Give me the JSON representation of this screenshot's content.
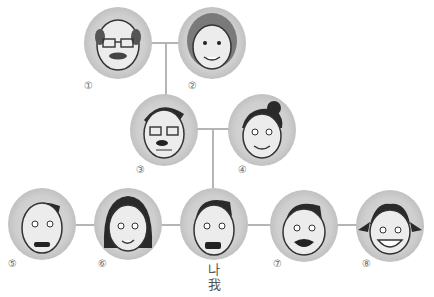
{
  "diagram": {
    "type": "family-tree",
    "members": [
      {
        "id": "1",
        "marker": "①",
        "depiction": "grandfather (bald, glasses, mustache)",
        "generation": 1
      },
      {
        "id": "2",
        "marker": "②",
        "depiction": "grandmother (curly hair)",
        "generation": 1
      },
      {
        "id": "3",
        "marker": "③",
        "depiction": "father (glasses, mustache)",
        "generation": 2
      },
      {
        "id": "4",
        "marker": "④",
        "depiction": "mother (hair bun)",
        "generation": 2
      },
      {
        "id": "5",
        "marker": "⑤",
        "depiction": "older brother",
        "generation": 3
      },
      {
        "id": "6",
        "marker": "⑥",
        "depiction": "older sister",
        "generation": 3
      },
      {
        "id": "me",
        "marker": "",
        "label_ko": "나",
        "label_zh": "我",
        "depiction": "me (boy)",
        "generation": 3
      },
      {
        "id": "7",
        "marker": "⑦",
        "depiction": "younger brother",
        "generation": 3
      },
      {
        "id": "8",
        "marker": "⑧",
        "depiction": "younger sister (pigtails)",
        "generation": 3
      }
    ],
    "colors": {
      "circle": "#cfcfcf",
      "line": "#b5b5b5",
      "face": "#ececec",
      "hair": "#2a2a2a"
    }
  }
}
